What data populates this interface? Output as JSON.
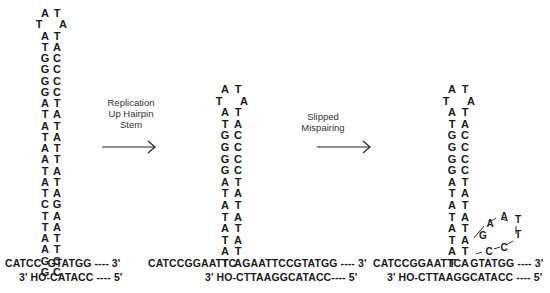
{
  "panels": [
    {
      "name": "hairpin",
      "loop_left": [
        "A",
        "T"
      ],
      "loop_right": [
        "T",
        "A"
      ],
      "stem_left": [
        "A",
        "T",
        "G",
        "G",
        "G",
        "G",
        "A",
        "T",
        "A",
        "T",
        "A",
        "A",
        "T",
        "A",
        "T",
        "C",
        "T",
        "T",
        "A",
        "A",
        "G",
        "G"
      ],
      "stem_right": [
        "T",
        "A",
        "C",
        "C",
        "C",
        "C",
        "T",
        "A",
        "T",
        "A",
        "T",
        "T",
        "A",
        "T",
        "A",
        "G",
        "A",
        "A",
        "T",
        "T",
        "C",
        "C"
      ],
      "top_strand": "CATCC  GTATGG ---- 3'",
      "bottom_strand": "3' HO-CATACC ---- 5'"
    },
    {
      "name": "replicated",
      "loop_left": [
        "A",
        "T"
      ],
      "loop_right": [
        "T",
        "A"
      ],
      "stem_left": [
        "A",
        "T",
        "G",
        "G",
        "G",
        "G",
        "A",
        "T",
        "A",
        "T",
        "A",
        "T",
        "A",
        "T"
      ],
      "stem_right": [
        "T",
        "A",
        "C",
        "C",
        "C",
        "C",
        "T",
        "A",
        "T",
        "A",
        "T",
        "A",
        "T",
        "A"
      ],
      "top_strand": "CATCCGGAATTC  GAATTCCGTATGG ---- 3'",
      "bottom_strand": "3' HO-CTTAAGGCATACC---- 5'"
    },
    {
      "name": "slipped",
      "loop_left": [
        "A",
        "T"
      ],
      "loop_right": [
        "T",
        "A"
      ],
      "stem_left": [
        "A",
        "T",
        "G",
        "G",
        "G",
        "G",
        "A",
        "T",
        "A",
        "T",
        "A",
        "T",
        "A",
        "T"
      ],
      "stem_right": [
        "T",
        "A",
        "C",
        "C",
        "C",
        "C",
        "T",
        "A",
        "T",
        "A",
        "T",
        "A",
        "T",
        "A"
      ],
      "bulge": [
        "G",
        "A",
        "A",
        "T",
        "T",
        "C",
        "C"
      ],
      "top_strand": "CATCCGGAATTC   GTATGG ---- 3'",
      "bottom_strand": "3' HO-CTTAAGGCATACC ---- 5'"
    }
  ],
  "arrows": [
    {
      "label_lines": [
        "Replication",
        "Up Hairpin",
        "Stem"
      ]
    },
    {
      "label_lines": [
        "Slipped",
        "Mispairing"
      ]
    }
  ]
}
